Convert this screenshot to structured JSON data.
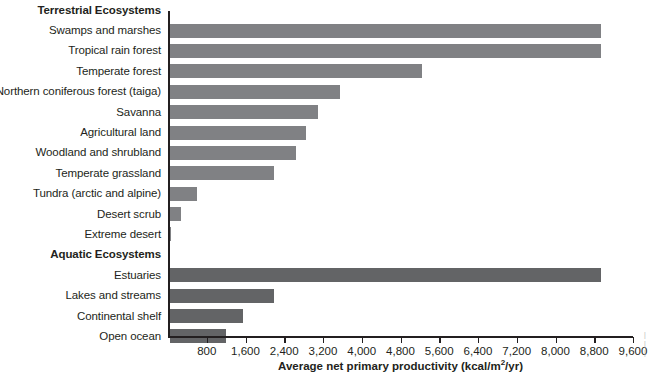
{
  "chart_data": {
    "type": "bar",
    "orientation": "horizontal",
    "title": "",
    "xlabel": "Average net primary productivity (kcal/m2/yr)",
    "xlabel_parts": {
      "before": "Average net primary productivity (kcal/m",
      "sup": "2",
      "after": "/yr)"
    },
    "ylabel": "",
    "xlim": [
      0,
      9600
    ],
    "xticks": [
      800,
      1600,
      2400,
      3200,
      4000,
      4800,
      5600,
      6400,
      7200,
      8000,
      8800,
      9600
    ],
    "xtick_labels": [
      "800",
      "1,600",
      "2,400",
      "3,200",
      "4,000",
      "4,800",
      "5,600",
      "6,400",
      "7,200",
      "8,000",
      "8,800",
      "9,600"
    ],
    "grid": false,
    "legend": "none",
    "groups": [
      {
        "name": "Terrestrial Ecosystems",
        "color": "#808184",
        "categories": [
          "Swamps and marshes",
          "Tropical rain forest",
          "Temperate forest",
          "Northern coniferous forest (taiga)",
          "Savanna",
          "Agricultural land",
          "Woodland and shrubland",
          "Temperate grassland",
          "Tundra (arctic and alpine)",
          "Desert scrub",
          "Extreme desert"
        ],
        "values": [
          8900,
          8900,
          5200,
          3500,
          3050,
          2800,
          2600,
          2150,
          550,
          230,
          30
        ]
      },
      {
        "name": "Aquatic Ecosystems",
        "color": "#636466",
        "categories": [
          "Estuaries",
          "Lakes and streams",
          "Continental shelf",
          "Open ocean"
        ],
        "values": [
          8900,
          2150,
          1500,
          1150
        ]
      }
    ],
    "rows": [
      {
        "kind": "group",
        "label": "Terrestrial Ecosystems",
        "value": null
      },
      {
        "kind": "bar",
        "series": "terrestrial",
        "label": "Swamps and marshes",
        "value": 8900
      },
      {
        "kind": "bar",
        "series": "terrestrial",
        "label": "Tropical rain forest",
        "value": 8900
      },
      {
        "kind": "bar",
        "series": "terrestrial",
        "label": "Temperate forest",
        "value": 5200
      },
      {
        "kind": "bar",
        "series": "terrestrial",
        "label": "Northern coniferous forest (taiga)",
        "value": 3500
      },
      {
        "kind": "bar",
        "series": "terrestrial",
        "label": "Savanna",
        "value": 3050
      },
      {
        "kind": "bar",
        "series": "terrestrial",
        "label": "Agricultural land",
        "value": 2800
      },
      {
        "kind": "bar",
        "series": "terrestrial",
        "label": "Woodland and shrubland",
        "value": 2600
      },
      {
        "kind": "bar",
        "series": "terrestrial",
        "label": "Temperate grassland",
        "value": 2150
      },
      {
        "kind": "bar",
        "series": "terrestrial",
        "label": "Tundra (arctic and alpine)",
        "value": 550
      },
      {
        "kind": "bar",
        "series": "terrestrial",
        "label": "Desert scrub",
        "value": 230
      },
      {
        "kind": "bar",
        "series": "terrestrial",
        "label": "Extreme desert",
        "value": 30
      },
      {
        "kind": "group",
        "label": "Aquatic Ecosystems",
        "value": null
      },
      {
        "kind": "bar",
        "series": "aquatic",
        "label": "Estuaries",
        "value": 8900
      },
      {
        "kind": "bar",
        "series": "aquatic",
        "label": "Lakes and streams",
        "value": 2150
      },
      {
        "kind": "bar",
        "series": "aquatic",
        "label": "Continental shelf",
        "value": 1500
      },
      {
        "kind": "bar",
        "series": "aquatic",
        "label": "Open ocean",
        "value": 1150
      }
    ]
  }
}
